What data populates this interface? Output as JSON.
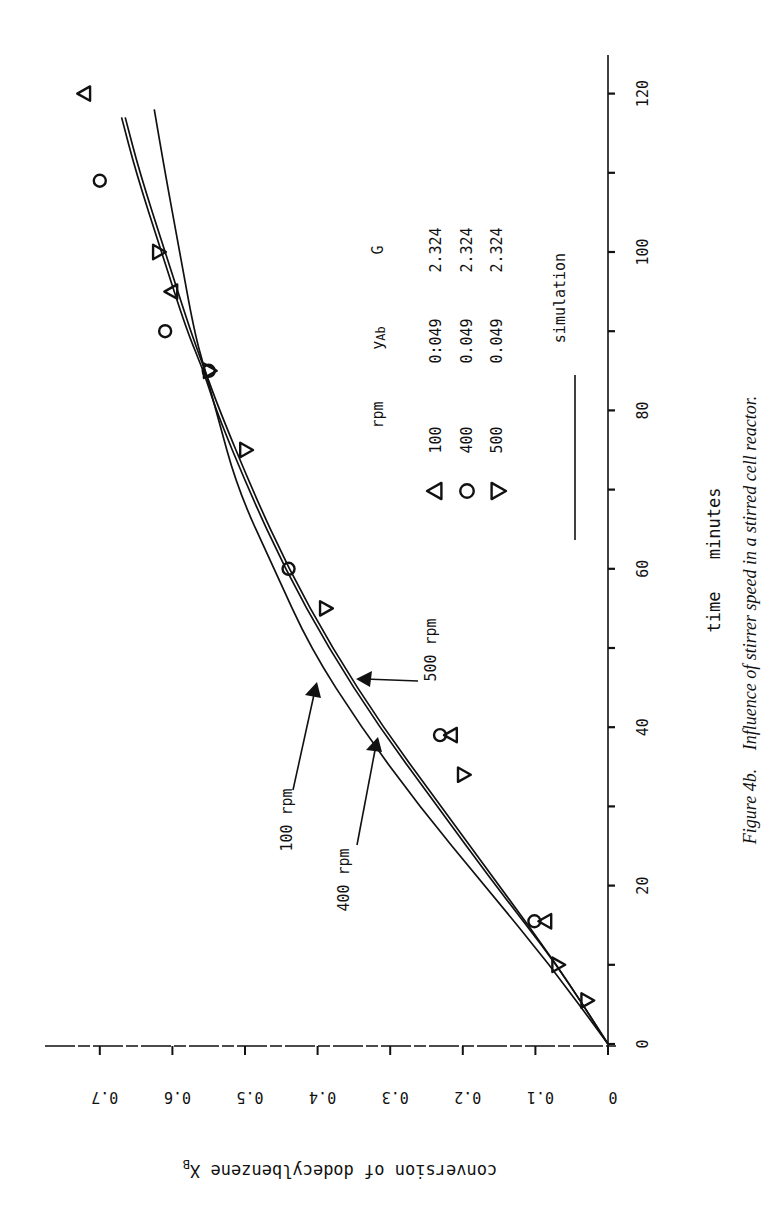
{
  "figure": {
    "caption_label": "Figure 4b.",
    "caption_text": "Influence of stirrer speed in a stirred cell reactor.",
    "orientation": "rotated 90° counter-clockwise"
  },
  "axes": {
    "x_label": "time",
    "x_unit": "minutes",
    "y_label": "conversion of dodecylbenzene X",
    "y_label_subscript": "B",
    "x_ticks": [
      "0",
      "20",
      "40",
      "60",
      "80",
      "100",
      "120"
    ],
    "y_ticks": [
      "0",
      "0.1",
      "0.2",
      "0.3",
      "0.4",
      "0.5",
      "0.6",
      "0.7"
    ]
  },
  "legend": {
    "header": {
      "rpm": "rpm",
      "yab": "y",
      "yab_sub": "Ab",
      "g": "G"
    },
    "rows": [
      {
        "marker": "triangle-up",
        "rpm": "100",
        "yab": "0:049",
        "g": "2.324"
      },
      {
        "marker": "circle",
        "rpm": "400",
        "yab": "0.049",
        "g": "2.324"
      },
      {
        "marker": "triangle-down",
        "rpm": "500",
        "yab": "0.049",
        "g": "2.324"
      }
    ],
    "line_label": "simulation"
  },
  "annotations": [
    {
      "text": "100 rpm"
    },
    {
      "text": "400 rpm"
    },
    {
      "text": "500 rpm"
    }
  ],
  "colors": {
    "ink": "#111111",
    "background": "#ffffff"
  },
  "chart_data": {
    "type": "scatter",
    "title": "Figure 4b. Influence of stirrer speed in a stirred cell reactor.",
    "xlabel": "time  minutes",
    "ylabel": "conversion of dodecylbenzene X_B",
    "xlim": [
      0,
      125
    ],
    "ylim": [
      0,
      0.75
    ],
    "grid": false,
    "legend_position": "inside, upper-left (in unrotated frame)",
    "series": [
      {
        "name": "100 rpm (y_Ab 0:049, G 2.324)",
        "marker": "triangle-up",
        "x": [
          15.5,
          39,
          95,
          120
        ],
        "y": [
          0.1,
          0.23,
          0.6,
          0.72
        ]
      },
      {
        "name": "400 rpm (y_Ab 0.049, G 2.324)",
        "marker": "circle",
        "x": [
          15.5,
          39,
          60,
          85,
          90,
          109
        ],
        "y": [
          0.1,
          0.23,
          0.44,
          0.55,
          0.61,
          0.7
        ]
      },
      {
        "name": "500 rpm (y_Ab 0.049, G 2.324)",
        "marker": "triangle-down",
        "x": [
          5.5,
          10,
          34,
          55,
          75,
          85,
          100
        ],
        "y": [
          0.03,
          0.07,
          0.2,
          0.39,
          0.5,
          0.55,
          0.62
        ]
      },
      {
        "name": "simulation 100 rpm",
        "type": "line",
        "x": [
          0,
          10,
          20,
          30,
          40,
          50,
          60,
          70,
          80,
          85,
          90,
          100,
          110,
          118
        ],
        "y": [
          0,
          0.08,
          0.17,
          0.26,
          0.34,
          0.41,
          0.46,
          0.51,
          0.54,
          0.555,
          0.57,
          0.59,
          0.61,
          0.625
        ]
      },
      {
        "name": "simulation 400 rpm",
        "type": "line",
        "x": [
          0,
          10,
          20,
          30,
          40,
          50,
          60,
          70,
          80,
          85,
          90,
          100,
          110,
          117
        ],
        "y": [
          0,
          0.07,
          0.15,
          0.23,
          0.31,
          0.38,
          0.44,
          0.49,
          0.535,
          0.555,
          0.575,
          0.61,
          0.645,
          0.665
        ]
      },
      {
        "name": "simulation 500 rpm",
        "type": "line",
        "x": [
          0,
          10,
          20,
          30,
          40,
          50,
          60,
          70,
          80,
          85,
          90,
          100,
          110,
          117
        ],
        "y": [
          0,
          0.07,
          0.155,
          0.235,
          0.315,
          0.385,
          0.445,
          0.495,
          0.54,
          0.557,
          0.58,
          0.615,
          0.65,
          0.67
        ]
      }
    ]
  }
}
